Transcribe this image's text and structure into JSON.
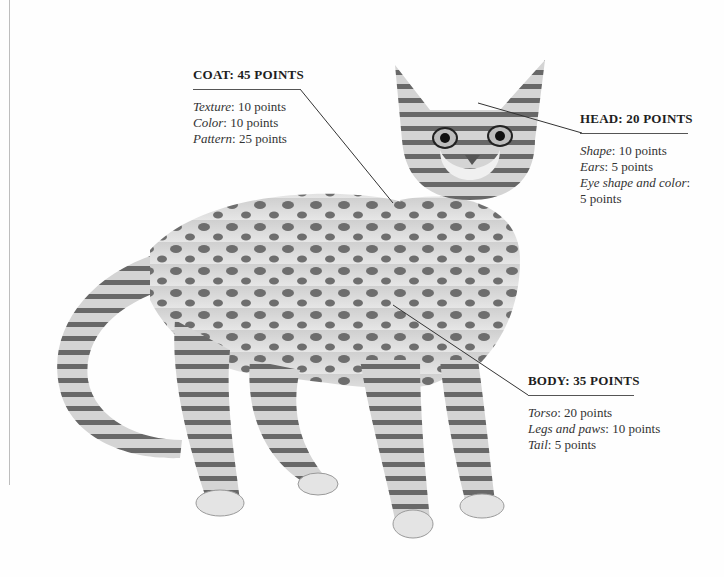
{
  "illustration": {
    "subject": "spotted tabby cat standing, facing viewer",
    "colors": {
      "background": "#fefefe",
      "line": "#555555",
      "text": "#2a2a2a",
      "fur_light": "#d6d6d6",
      "fur_dark": "#3a3a3a"
    }
  },
  "coat": {
    "title": "COAT: 45 POINTS",
    "items": [
      {
        "name": "Texture",
        "value": "10 points"
      },
      {
        "name": "Color",
        "value": "10 points"
      },
      {
        "name": "Pattern",
        "value": "25 points"
      }
    ]
  },
  "head": {
    "title": "HEAD: 20 POINTS",
    "items": [
      {
        "name": "Shape",
        "value": "10 points"
      },
      {
        "name": "Ears",
        "value": "5 points"
      },
      {
        "name": "Eye shape and color",
        "value": ""
      },
      {
        "name": "",
        "value": "5 points"
      }
    ]
  },
  "body": {
    "title": "BODY: 35 POINTS",
    "items": [
      {
        "name": "Torso",
        "value": "20 points"
      },
      {
        "name": "Legs and paws",
        "value": "10 points"
      },
      {
        "name": "Tail",
        "value": "5 points"
      }
    ]
  }
}
